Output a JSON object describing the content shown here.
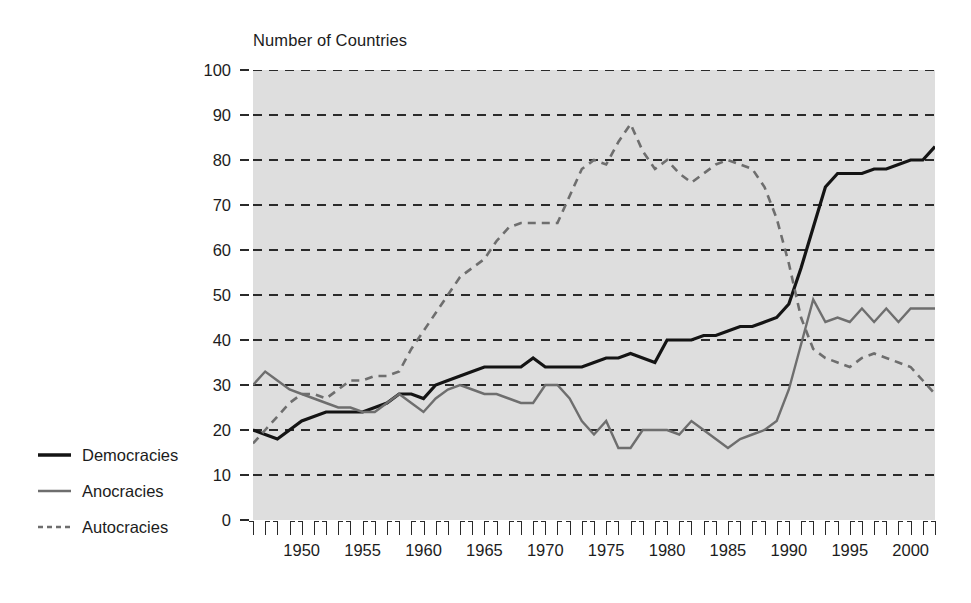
{
  "chart_data": {
    "type": "line",
    "title": "Number of Countries",
    "xlabel": "",
    "ylabel": "",
    "xlim": [
      1946,
      2002
    ],
    "ylim": [
      0,
      100
    ],
    "ytick_step": 10,
    "yticks": [
      0,
      10,
      20,
      30,
      40,
      50,
      60,
      70,
      80,
      90,
      100
    ],
    "xticks_labeled": [
      1950,
      1955,
      1960,
      1965,
      1970,
      1975,
      1980,
      1985,
      1990,
      1995,
      2000
    ],
    "xtick_every": 1,
    "grid": "horizontal-dashed",
    "legend_position": "outside-left-bottom",
    "plot_background": "#dedede",
    "x": [
      1946,
      1947,
      1948,
      1949,
      1950,
      1951,
      1952,
      1953,
      1954,
      1955,
      1956,
      1957,
      1958,
      1959,
      1960,
      1961,
      1962,
      1963,
      1964,
      1965,
      1966,
      1967,
      1968,
      1969,
      1970,
      1971,
      1972,
      1973,
      1974,
      1975,
      1976,
      1977,
      1978,
      1979,
      1980,
      1981,
      1982,
      1983,
      1984,
      1985,
      1986,
      1987,
      1988,
      1989,
      1990,
      1991,
      1992,
      1993,
      1994,
      1995,
      1996,
      1997,
      1998,
      1999,
      2000,
      2001,
      2002
    ],
    "series": [
      {
        "name": "Democracies",
        "color": "#141414",
        "style": "solid",
        "width": 3.2,
        "values": [
          20,
          19,
          18,
          20,
          22,
          23,
          24,
          24,
          24,
          24,
          25,
          26,
          28,
          28,
          27,
          30,
          31,
          32,
          33,
          34,
          34,
          34,
          34,
          36,
          34,
          34,
          34,
          34,
          35,
          36,
          36,
          37,
          36,
          35,
          40,
          40,
          40,
          41,
          41,
          42,
          43,
          43,
          44,
          45,
          48,
          56,
          65,
          74,
          77,
          77,
          77,
          78,
          78,
          79,
          80,
          80,
          83
        ]
      },
      {
        "name": "Anocracies",
        "color": "#6e6e6e",
        "style": "solid",
        "width": 2.4,
        "values": [
          30,
          33,
          31,
          29,
          28,
          27,
          26,
          25,
          25,
          24,
          24,
          26,
          28,
          26,
          24,
          27,
          29,
          30,
          29,
          28,
          28,
          27,
          26,
          26,
          30,
          30,
          27,
          22,
          19,
          22,
          16,
          16,
          20,
          20,
          20,
          19,
          22,
          20,
          18,
          16,
          18,
          19,
          20,
          22,
          29,
          39,
          49,
          44,
          45,
          44,
          47,
          44,
          47,
          44,
          47,
          47,
          47
        ]
      },
      {
        "name": "Autocracies",
        "color": "#6e6e6e",
        "style": "dashed",
        "width": 2.6,
        "values": [
          17,
          20,
          23,
          26,
          28,
          28,
          27,
          29,
          31,
          31,
          32,
          32,
          33,
          38,
          42,
          46,
          50,
          54,
          56,
          58,
          62,
          65,
          66,
          66,
          66,
          66,
          72,
          78,
          80,
          79,
          84,
          88,
          82,
          78,
          80,
          77,
          75,
          77,
          79,
          80,
          79,
          78,
          74,
          67,
          57,
          45,
          38,
          36,
          35,
          34,
          36,
          37,
          36,
          35,
          34,
          31,
          28
        ]
      }
    ]
  },
  "legend": {
    "items": [
      {
        "label": "Democracies",
        "color": "#141414",
        "style": "solid",
        "width": 3.4
      },
      {
        "label": "Anocracies",
        "color": "#6e6e6e",
        "style": "solid",
        "width": 2.6
      },
      {
        "label": "Autocracies",
        "color": "#6e6e6e",
        "style": "dashed",
        "width": 2.6
      }
    ]
  }
}
